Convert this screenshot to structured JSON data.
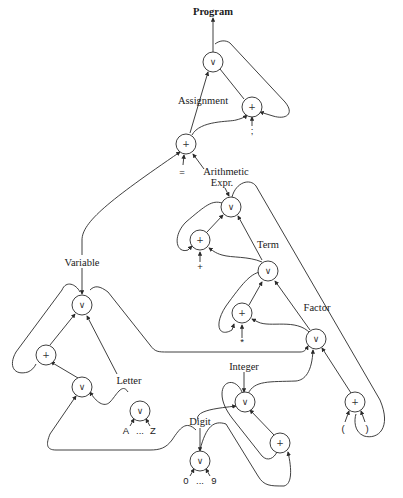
{
  "diagram": {
    "type": "grammar-recognition-network",
    "nonterminals": {
      "program": "Program",
      "assignment": "Assignment",
      "arith_line1": "Arithmetic",
      "arith_line2": "Expr.",
      "term": "Term",
      "factor": "Factor",
      "variable": "Variable",
      "letter": "Letter",
      "integer": "Integer",
      "digit": "Digit"
    },
    "node_symbols": {
      "or": "∨",
      "and": "+"
    },
    "terminals": {
      "semicolon": ";",
      "equals": "=",
      "plus": "+",
      "times": "*",
      "lparen": "(",
      "rparen": ")",
      "letter_from": "A",
      "letter_ellipsis": "...",
      "letter_to": "Z",
      "digit_from": "0",
      "digit_ellipsis": "...",
      "digit_to": "9"
    }
  }
}
